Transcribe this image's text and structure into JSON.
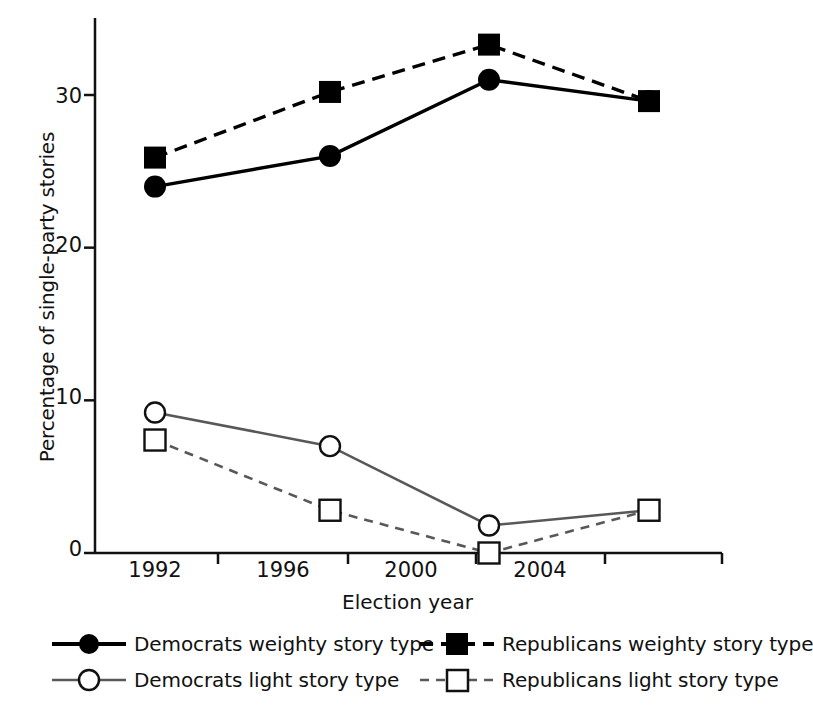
{
  "chart_data": {
    "type": "line",
    "title": "",
    "xlabel": "Election year",
    "ylabel": "Percentage of single-party stories",
    "categories": [
      "1992",
      "1996",
      "2000",
      "2004"
    ],
    "x": [
      1992,
      1996,
      2000,
      2004
    ],
    "ylim": [
      0,
      34
    ],
    "yticks": [
      0,
      10,
      20,
      30
    ],
    "ytick_labels": [
      "0",
      "10",
      "20",
      "30"
    ],
    "xtick_labels": [
      "1992",
      "1996",
      "2000",
      "2004"
    ],
    "grid": false,
    "legend_position": "below-plot",
    "series": [
      {
        "name": "Democrats weighty story type",
        "values": [
          24.0,
          26.0,
          31.0,
          29.6
        ],
        "marker": "filled-circle",
        "line_style": "solid",
        "color": "#000000"
      },
      {
        "name": "Republicans weighty story type",
        "values": [
          25.9,
          30.2,
          33.3,
          29.6
        ],
        "marker": "filled-square",
        "line_style": "dashed",
        "color": "#000000"
      },
      {
        "name": "Democrats light story type",
        "values": [
          9.2,
          7.0,
          1.8,
          2.8
        ],
        "marker": "open-circle",
        "line_style": "solid",
        "color": "#585858"
      },
      {
        "name": "Republicans light story type",
        "values": [
          7.4,
          2.8,
          0.0,
          2.8
        ],
        "marker": "open-square",
        "line_style": "dashed",
        "color": "#585858"
      }
    ]
  },
  "legend": {
    "entries": [
      {
        "label": "Democrats weighty story type"
      },
      {
        "label": "Republicans weighty story type"
      },
      {
        "label": "Democrats light story type"
      },
      {
        "label": "Republicans light story type"
      }
    ]
  }
}
